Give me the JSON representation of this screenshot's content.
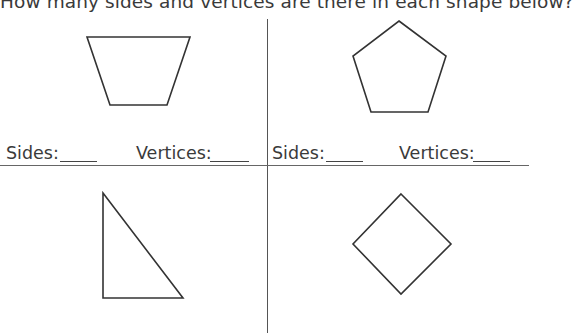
{
  "worksheet": {
    "question": "How many sides and vertices are there in each shape below?",
    "panels": [
      {
        "shape": "trapezoid",
        "sides_label": "Sides:",
        "vertices_label": "Vertices:"
      },
      {
        "shape": "pentagon",
        "sides_label": "Sides:",
        "vertices_label": "Vertices:"
      },
      {
        "shape": "right-triangle"
      },
      {
        "shape": "diamond"
      }
    ]
  }
}
